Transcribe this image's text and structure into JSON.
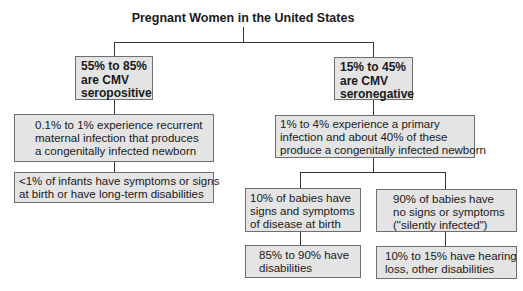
{
  "title": "Pregnant Women in the United States",
  "nodes": {
    "seropositive": "55% to 85%\nare CMV\nseropositive",
    "seronegative": "15% to 45%\nare CMV\nseronegative",
    "recurrent": "0.1% to 1% experience recurrent\nmaternal infection that produces\na congenitally infected newborn",
    "recurrent_outcome": "<1% of infants have symptoms or signs\nat birth or have long-term disabilities",
    "primary": "1% to 4% experience a primary\ninfection and about 40% of these\nproduce a congenitally infected newborn",
    "symptomatic": "10% of babies have\nsigns and symptoms\nof disease at birth",
    "symptomatic_outcome": "85% to 90% have\ndisabilities",
    "asymptomatic": "90% of babies have\nno signs or symptoms\n(\"silently infected\")",
    "asymptomatic_outcome": "10% to 15% have hearing\nloss, other disabilities"
  },
  "colors": {
    "box_fill": "#e4e4e4",
    "box_border": "#6f6f6f",
    "line": "#333333"
  }
}
